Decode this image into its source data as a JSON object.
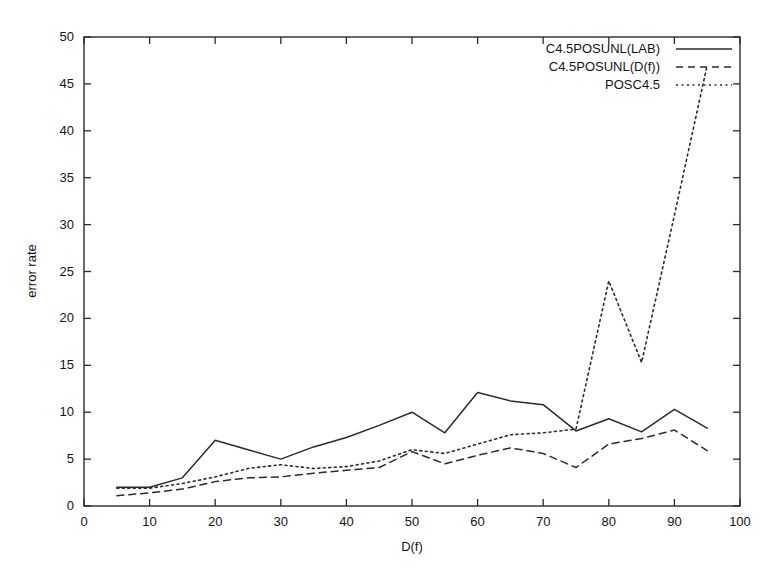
{
  "chart_data": {
    "type": "line",
    "title": "",
    "xlabel": "D(f)",
    "ylabel": "error rate",
    "xlim": [
      0,
      100
    ],
    "ylim": [
      0,
      50
    ],
    "xticks": [
      0,
      10,
      20,
      30,
      40,
      50,
      60,
      70,
      80,
      90,
      100
    ],
    "yticks": [
      0,
      5,
      10,
      15,
      20,
      25,
      30,
      35,
      40,
      45,
      50
    ],
    "grid": false,
    "legend_position": "top-right",
    "x": [
      5,
      10,
      15,
      20,
      25,
      30,
      35,
      40,
      45,
      50,
      55,
      60,
      65,
      70,
      75,
      80,
      85,
      90,
      95
    ],
    "series": [
      {
        "name": "C4.5POSUNL(LAB)",
        "style": "solid",
        "values": [
          2.0,
          2.0,
          3.0,
          7.0,
          6.0,
          5.0,
          6.3,
          7.3,
          8.6,
          10.0,
          7.8,
          12.1,
          11.2,
          10.8,
          8.0,
          9.3,
          7.9,
          10.3,
          8.3
        ]
      },
      {
        "name": "C4.5POSUNL(D(f))",
        "style": "dashed",
        "values": [
          1.1,
          1.4,
          1.8,
          2.6,
          3.0,
          3.1,
          3.5,
          3.8,
          4.1,
          5.8,
          4.5,
          5.4,
          6.2,
          5.6,
          4.1,
          6.6,
          7.2,
          8.1,
          5.9
        ]
      },
      {
        "name": "POSC4.5",
        "style": "dotted",
        "values": [
          1.9,
          1.9,
          2.4,
          3.1,
          4.0,
          4.4,
          4.0,
          4.2,
          4.8,
          6.0,
          5.6,
          6.6,
          7.6,
          7.8,
          8.2,
          24.0,
          15.3,
          31.0,
          47.0
        ]
      }
    ],
    "legend": [
      {
        "label": "C4.5POSUNL(LAB)",
        "style": "solid"
      },
      {
        "label": "C4.5POSUNL(D(f))",
        "style": "dashed"
      },
      {
        "label": "POSC4.5",
        "style": "dotted"
      }
    ]
  }
}
